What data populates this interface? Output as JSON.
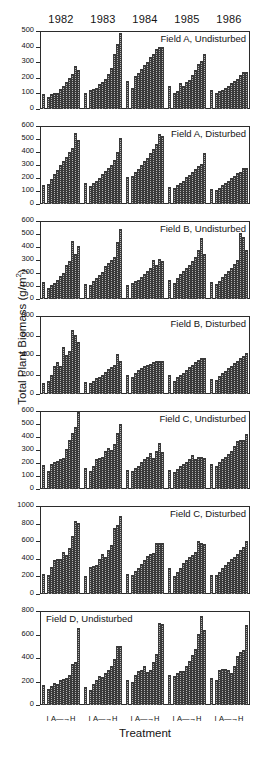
{
  "figure": {
    "ylabel_text": "Total Plant Biomass (g/m",
    "ylabel_sup": "2",
    "ylabel_tail": ")",
    "xlabel": "Treatment",
    "years": [
      "1982",
      "1983",
      "1984",
      "1985",
      "1986"
    ],
    "xtick": {
      "initial": "I",
      "gradient_start": "A",
      "arrow": "—→",
      "gradient_end": "H"
    }
  },
  "chart_data": {
    "type": "bar",
    "xlabel": "Treatment",
    "ylabel": "Total Plant Biomass (g/m2)",
    "grid": false,
    "legend": "none",
    "categories": [
      "I",
      "A",
      "B",
      "C",
      "D",
      "E",
      "F",
      "G",
      "H"
    ],
    "x_group_labels": [
      "1982",
      "1983",
      "1984",
      "1985",
      "1986"
    ],
    "note": "Each year group shows one isolated control bar (I) then a gradient series A through H; values estimated from axis gridlines in g/m^2.",
    "panels": [
      {
        "name": "Field A, Undisturbed",
        "title_align": "right",
        "ylim": [
          0,
          500
        ],
        "yticks": [
          0,
          100,
          200,
          300,
          400,
          500
        ],
        "groups": [
          {
            "year": "1982",
            "values": [
              95,
              80,
              95,
              100,
              105,
              130,
              150,
              175,
              200,
              225,
              275,
              250
            ]
          },
          {
            "year": "1983",
            "values": [
              105,
              125,
              130,
              135,
              160,
              175,
              190,
              225,
              260,
              350,
              415,
              485
            ]
          },
          {
            "year": "1984",
            "values": [
              180,
              135,
              210,
              230,
              255,
              280,
              300,
              335,
              350,
              385,
              400,
              400
            ]
          },
          {
            "year": "1985",
            "values": [
              150,
              105,
              115,
              165,
              150,
              170,
              185,
              215,
              250,
              290,
              310,
              355
            ]
          },
          {
            "year": "1986",
            "values": [
              120,
              105,
              115,
              125,
              135,
              150,
              165,
              180,
              195,
              215,
              240,
              235
            ]
          }
        ]
      },
      {
        "name": "Field A, Disturbed",
        "title_align": "right",
        "ylim": [
          0,
          600
        ],
        "yticks": [
          0,
          100,
          200,
          300,
          400,
          500,
          600
        ],
        "groups": [
          {
            "year": "1982",
            "values": [
              150,
              155,
              195,
              230,
              265,
              300,
              330,
              360,
              400,
              430,
              550,
              490
            ]
          },
          {
            "year": "1983",
            "values": [
              165,
              140,
              165,
              180,
              200,
              230,
              255,
              280,
              300,
              340,
              400,
              510
            ]
          },
          {
            "year": "1984",
            "values": [
              210,
              215,
              250,
              270,
              300,
              330,
              355,
              390,
              420,
              460,
              540,
              520
            ]
          },
          {
            "year": "1985",
            "values": [
              130,
              125,
              145,
              160,
              180,
              205,
              225,
              250,
              270,
              290,
              310,
              395
            ]
          },
          {
            "year": "1986",
            "values": [
              115,
              110,
              125,
              145,
              160,
              180,
              200,
              215,
              235,
              250,
              280,
              275
            ]
          }
        ]
      },
      {
        "name": "Field B, Undisturbed",
        "title_align": "right",
        "ylim": [
          0,
          600
        ],
        "yticks": [
          0,
          100,
          200,
          300,
          400,
          500,
          600
        ],
        "groups": [
          {
            "year": "1982",
            "values": [
              130,
              85,
              105,
              125,
              150,
              175,
              200,
              265,
              290,
              445,
              345,
              405
            ]
          },
          {
            "year": "1983",
            "values": [
              115,
              110,
              135,
              160,
              185,
              210,
              255,
              280,
              300,
              320,
              440,
              540
            ]
          },
          {
            "year": "1984",
            "values": [
              105,
              120,
              135,
              150,
              170,
              195,
              215,
              235,
              300,
              265,
              310,
              295
            ]
          },
          {
            "year": "1985",
            "values": [
              150,
              125,
              160,
              190,
              215,
              240,
              265,
              290,
              320,
              380,
              470,
              350
            ]
          },
          {
            "year": "1986",
            "values": [
              130,
              115,
              140,
              170,
              190,
              215,
              240,
              270,
              300,
              505,
              480,
              375
            ]
          }
        ]
      },
      {
        "name": "Field B, Disturbed",
        "title_align": "right",
        "ylim": [
          0,
          800
        ],
        "yticks": [
          0,
          200,
          400,
          600,
          800
        ],
        "groups": [
          {
            "year": "1982",
            "values": [
              110,
              130,
              190,
              290,
              325,
              290,
              480,
              400,
              440,
              655,
              610,
              535
            ]
          },
          {
            "year": "1983",
            "values": [
              125,
              110,
              135,
              165,
              170,
              200,
              230,
              255,
              280,
              300,
              415,
              335
            ]
          },
          {
            "year": "1984",
            "values": [
              195,
              175,
              220,
              250,
              265,
              285,
              295,
              310,
              330,
              340,
              335,
              335
            ]
          },
          {
            "year": "1985",
            "values": [
              200,
              130,
              175,
              195,
              215,
              245,
              275,
              300,
              325,
              345,
              370,
              365
            ]
          },
          {
            "year": "1986",
            "values": [
              155,
              145,
              185,
              215,
              240,
              265,
              290,
              315,
              340,
              365,
              390,
              420
            ]
          }
        ]
      },
      {
        "name": "Field C, Undisturbed",
        "title_align": "right",
        "ylim": [
          0,
          600
        ],
        "yticks": [
          0,
          100,
          200,
          300,
          400,
          500,
          600
        ],
        "groups": [
          {
            "year": "1982",
            "values": [
              185,
              140,
              195,
              210,
              215,
              230,
              235,
              310,
              375,
              430,
              475,
              590
            ]
          },
          {
            "year": "1983",
            "values": [
              160,
              140,
              175,
              230,
              235,
              250,
              290,
              315,
              300,
              350,
              430,
              500
            ]
          },
          {
            "year": "1984",
            "values": [
              150,
              140,
              165,
              180,
              205,
              230,
              250,
              275,
              240,
              290,
              355,
              285
            ]
          },
          {
            "year": "1985",
            "values": [
              150,
              130,
              155,
              175,
              190,
              205,
              230,
              265,
              230,
              245,
              245,
              240
            ]
          },
          {
            "year": "1986",
            "values": [
              195,
              175,
              205,
              230,
              250,
              270,
              290,
              330,
              370,
              375,
              375,
              425
            ]
          }
        ]
      },
      {
        "name": "Field C, Disturbed",
        "title_align": "right",
        "ylim": [
          0,
          1000
        ],
        "yticks": [
          0,
          200,
          400,
          600,
          800,
          1000
        ],
        "groups": [
          {
            "year": "1982",
            "values": [
              230,
              215,
              310,
              390,
              395,
              400,
              480,
              445,
              525,
              655,
              835,
              810
            ]
          },
          {
            "year": "1983",
            "values": [
              200,
              310,
              320,
              330,
              400,
              460,
              420,
              505,
              560,
              755,
              780,
              890
            ]
          },
          {
            "year": "1984",
            "values": [
              225,
              215,
              265,
              300,
              345,
              385,
              430,
              455,
              470,
              580,
              580,
              575
            ]
          },
          {
            "year": "1985",
            "values": [
              300,
              200,
              255,
              300,
              355,
              390,
              420,
              445,
              480,
              600,
              580,
              570
            ]
          },
          {
            "year": "1986",
            "values": [
              220,
              215,
              250,
              290,
              325,
              360,
              395,
              425,
              460,
              500,
              530,
              600
            ]
          }
        ]
      },
      {
        "name": "Field D, Undisturbed",
        "title_align": "left",
        "ylim": [
          0,
          800
        ],
        "yticks": [
          0,
          200,
          400,
          600,
          800
        ],
        "groups": [
          {
            "year": "1982",
            "values": [
              170,
              135,
              165,
              185,
              175,
              215,
              225,
              230,
              255,
              345,
              370,
              655
            ]
          },
          {
            "year": "1983",
            "values": [
              150,
              130,
              180,
              215,
              245,
              235,
              270,
              300,
              330,
              390,
              505,
              500
            ]
          },
          {
            "year": "1984",
            "values": [
              215,
              200,
              255,
              290,
              300,
              330,
              280,
              300,
              370,
              430,
              700,
              690
            ]
          },
          {
            "year": "1985",
            "values": [
              255,
              245,
              275,
              290,
              290,
              330,
              375,
              425,
              475,
              605,
              755,
              640
            ]
          },
          {
            "year": "1986",
            "values": [
              230,
              215,
              300,
              310,
              305,
              300,
              270,
              335,
              415,
              450,
              465,
              680
            ]
          }
        ]
      }
    ]
  }
}
